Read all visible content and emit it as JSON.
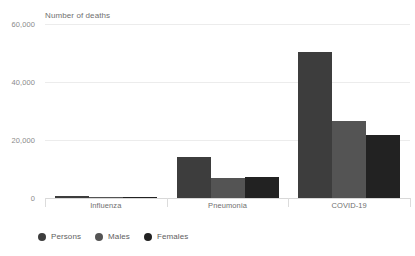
{
  "chart_data": {
    "type": "bar",
    "title": "Number of deaths",
    "xlabel": "",
    "ylabel": "Number of deaths",
    "categories": [
      "Influenza",
      "Pneumonia",
      "COVID-19"
    ],
    "series": [
      {
        "name": "Persons",
        "color": "#3d3d3d",
        "values": [
          600,
          14100,
          50300
        ]
      },
      {
        "name": "Males",
        "color": "#545454",
        "values": [
          300,
          6900,
          26700
        ]
      },
      {
        "name": "Females",
        "color": "#222222",
        "values": [
          300,
          7400,
          21700
        ]
      }
    ],
    "ylim": [
      0,
      60000
    ],
    "yticks": [
      0,
      20000,
      40000,
      60000
    ],
    "ytick_labels": [
      "0",
      "20,000",
      "40,000",
      "60,000"
    ],
    "grid": true,
    "legend_position": "bottom-left",
    "background": "#ffffff",
    "grid_color": "#ececec",
    "axis_color": "#d8d8d8",
    "label_color": "#6f6f6f"
  }
}
